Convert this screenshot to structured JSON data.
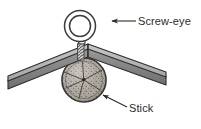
{
  "figure": {
    "background_color": "#ffffff",
    "width": 201,
    "height": 129
  },
  "labels": [
    {
      "id": "screw-eye",
      "text": "Screw-eye",
      "text_x": 138,
      "text_y": 25,
      "color": "#2b2b2b",
      "leader": {
        "from_x": 136,
        "from_y": 21,
        "to_x": 112,
        "to_y": 21,
        "arrow_direction": "left"
      }
    },
    {
      "id": "stick",
      "text": "Stick",
      "text_x": 129,
      "text_y": 112,
      "color": "#2b2b2b",
      "leader": {
        "from_x": 127,
        "from_y": 107,
        "to_x": 103,
        "to_y": 95,
        "arrow_direction": "up-left"
      }
    }
  ],
  "parts": {
    "screw_eye": {
      "name": "Screw-eye",
      "ring_center_x": 80,
      "ring_center_y": 26,
      "ring_outer_radius": 15,
      "ring_inner_radius": 10,
      "outline_color": "#3a3a3a",
      "fill_color": "#ffffff",
      "shank_top_y": 40,
      "shank_bottom_y": 78,
      "thread_color": "#4a4a4a"
    },
    "beam": {
      "name": "Angled wooden beam",
      "apex_x": 88,
      "apex_y": 48,
      "left_end_x": 8,
      "left_end_y": 80,
      "right_end_x": 166,
      "right_end_y": 76,
      "top_face_color": "#b4b4b4",
      "side_face_color": "#8d8d8d",
      "edge_color": "#2e2e2e",
      "thickness": 9
    },
    "stick": {
      "name": "Stick",
      "center_x": 84,
      "center_y": 80,
      "radius": 22,
      "fill_color": "#a9a39a",
      "outline_color": "#2b2b2b",
      "texture": "stippled end-grain with radial cracks",
      "stipple_color": "#4a4238"
    }
  },
  "colors": {
    "ink": "#2b2b2b",
    "wood_gray": "#a9a39a",
    "beam_light": "#b4b4b4",
    "beam_dark": "#8d8d8d",
    "paper": "#ffffff"
  }
}
